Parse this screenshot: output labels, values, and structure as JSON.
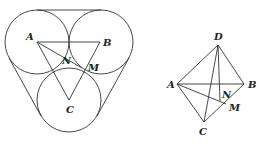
{
  "figures": [
    {
      "name": "three-circles",
      "description": "Three equal tangent circles with centers A, B, C enclosed by tangent lines; triangle ABC with points N and M",
      "labels": {
        "A": "A",
        "B": "B",
        "C": "C",
        "N": "N",
        "M": "M"
      }
    },
    {
      "name": "tetrahedron",
      "description": "Tetrahedron ABCD with foot N of perpendicular from D and point M on BC",
      "labels": {
        "A": "A",
        "B": "B",
        "C": "C",
        "D": "D",
        "N": "N",
        "M": "M"
      }
    }
  ],
  "stroke_color": "#333333"
}
